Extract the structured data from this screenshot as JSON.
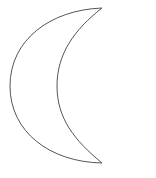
{
  "shape": {
    "name": "crescent-moon",
    "stroke_color": "#555555",
    "fill_color": "#ffffff",
    "stroke_width": 1
  }
}
